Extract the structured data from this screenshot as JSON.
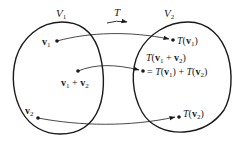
{
  "diagram": {
    "type": "linear-transformation-mapping",
    "sets": [
      {
        "id": "V1",
        "label": "V",
        "subscript": "1"
      },
      {
        "id": "V2",
        "label": "V",
        "subscript": "2"
      }
    ],
    "map": {
      "label": "T"
    },
    "domain_points": [
      {
        "id": "v1",
        "label": "v",
        "subscript": "1"
      },
      {
        "id": "v1_plus_v2",
        "label_parts": [
          "v",
          "1",
          " + ",
          "v",
          "2"
        ]
      },
      {
        "id": "v2",
        "label": "v",
        "subscript": "2"
      }
    ],
    "image_points": [
      {
        "id": "Tv1",
        "text": "T(v1)"
      },
      {
        "id": "Tv1v2",
        "line1": "T(v1 + v2)",
        "line2": "= T(v1) + T(v2)"
      },
      {
        "id": "Tv2",
        "text": "T(v2)"
      }
    ],
    "mappings": [
      {
        "from": "v1",
        "to": "Tv1"
      },
      {
        "from": "v1_plus_v2",
        "to": "Tv1v2"
      },
      {
        "from": "v2",
        "to": "Tv2"
      }
    ],
    "colors": {
      "stroke": "#1a1a1a",
      "background": "#ffffff"
    }
  }
}
